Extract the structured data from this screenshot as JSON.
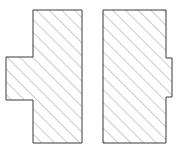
{
  "figure": {
    "background_color": "#fefefe",
    "width": 183,
    "height": 152,
    "shape_count": 2
  },
  "style": {
    "outline_color": "#3a3a3a",
    "outline_width": 1,
    "fill_color": "#ffffff",
    "hatch_color": "#8d8d8d",
    "hatch_width": 0.9,
    "hatch_spacing": 9,
    "hatch_angle_deg": 45,
    "hatch_direction": "lower-left-to-upper-right"
  },
  "shapes": [
    {
      "id": "left-shape",
      "name": "left-hatched-polygon",
      "description": "Tall rectangle with a rectangular tab protruding from its left side at mid-height",
      "bounds": {
        "x": 6,
        "y": 10,
        "width": 76,
        "height": 133
      },
      "body": {
        "x": 33,
        "y": 10,
        "width": 49,
        "height": 133
      },
      "tab": {
        "side": "left",
        "x": 6,
        "y": 57,
        "width": 27,
        "height": 43
      },
      "points": "33,10 82,10 82,143 33,143 33,100 6,100 6,57 33,57",
      "vertex_count": 8
    },
    {
      "id": "right-shape",
      "name": "right-hatched-polygon",
      "description": "Tall rectangle with a small rectangular tab protruding from its right side at mid-height",
      "bounds": {
        "x": 103,
        "y": 10,
        "width": 69,
        "height": 133
      },
      "body": {
        "x": 103,
        "y": 10,
        "width": 63,
        "height": 133
      },
      "tab": {
        "side": "right",
        "x": 166,
        "y": 58,
        "width": 6,
        "height": 39
      },
      "points": "103,10 166,10 166,58 172,58 172,97 166,97 166,143 103,143",
      "vertex_count": 8
    }
  ],
  "gap_between_shapes": {
    "from_x": 82,
    "to_x": 103,
    "width": 21
  }
}
